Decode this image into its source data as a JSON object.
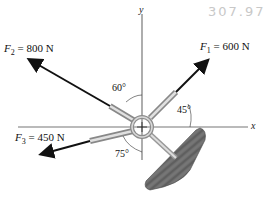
{
  "annotation": "307.97",
  "axes": {
    "x_label": "x",
    "y_label": "y"
  },
  "forces": [
    {
      "name": "F",
      "sub": "1",
      "value": "= 600 N"
    },
    {
      "name": "F",
      "sub": "2",
      "value": "= 800 N"
    },
    {
      "name": "F",
      "sub": "3",
      "value": "= 450 N"
    }
  ],
  "angles": {
    "f2_from_y": "60°",
    "f1_from_x": "45°",
    "f3_from_y": "75°"
  },
  "colors": {
    "arrow": "#111111",
    "axis": "#777777",
    "wood": "#6b6b6b",
    "ring": "#9a9a9a"
  }
}
